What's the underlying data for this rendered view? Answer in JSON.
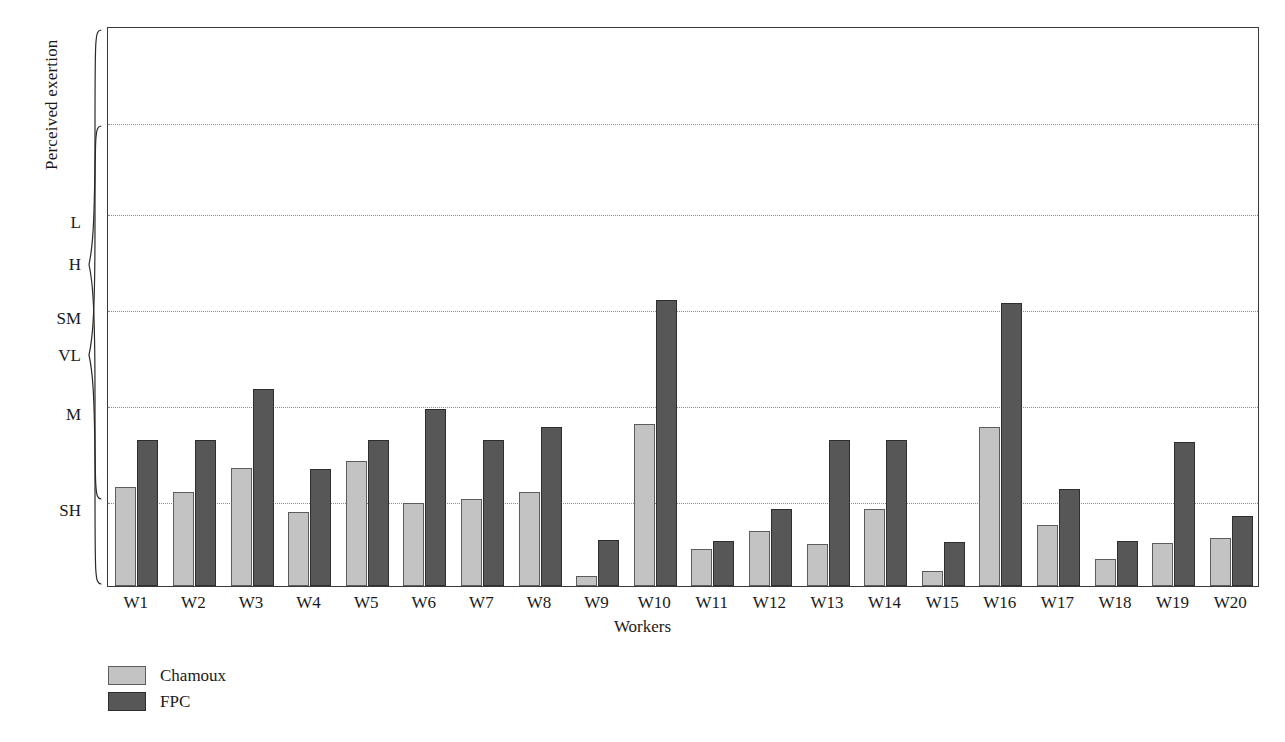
{
  "chart_data": {
    "type": "bar",
    "title": "",
    "xlabel": "Workers",
    "ylabel": "Perceived exertion",
    "grid": true,
    "legend_position": "bottom-left",
    "categories": [
      "W1",
      "W2",
      "W3",
      "W4",
      "W5",
      "W6",
      "W7",
      "W8",
      "W9",
      "W10",
      "W11",
      "W12",
      "W13",
      "W14",
      "W15",
      "W16",
      "W17",
      "W18",
      "W19",
      "W20"
    ],
    "y_categories": [
      "VL",
      "L",
      "SM",
      "M",
      "SH",
      "H"
    ],
    "y_category_order_bottom_to_top": [
      "VL",
      "L",
      "SM",
      "M",
      "SH",
      "H"
    ],
    "ylim": [
      0,
      6
    ],
    "y_tick_values": [
      0,
      1,
      2,
      3,
      4,
      5,
      6
    ],
    "series": [
      {
        "name": "Chamoux",
        "color": "#c3c3c3",
        "values": [
          1.06,
          1.01,
          1.26,
          0.79,
          1.34,
          0.89,
          0.93,
          1.01,
          0.11,
          1.74,
          0.4,
          0.59,
          0.45,
          0.83,
          0.16,
          1.7,
          0.65,
          0.29,
          0.46,
          0.51
        ]
      },
      {
        "name": "FPC",
        "color": "#575757",
        "values": [
          1.56,
          1.56,
          2.11,
          1.25,
          1.56,
          1.9,
          1.56,
          1.7,
          0.49,
          3.06,
          0.48,
          0.82,
          1.56,
          1.56,
          0.47,
          3.03,
          1.04,
          0.48,
          1.54,
          0.75
        ]
      }
    ],
    "axis_pixel_map": {
      "plot_top_px": 27,
      "plot_bottom_px": 587,
      "gridlines_px": [
        123,
        214,
        310,
        406,
        502
      ]
    }
  },
  "legend": {
    "items": [
      {
        "label": "Chamoux",
        "color": "#c3c3c3"
      },
      {
        "label": "FPC",
        "color": "#575757"
      }
    ]
  }
}
